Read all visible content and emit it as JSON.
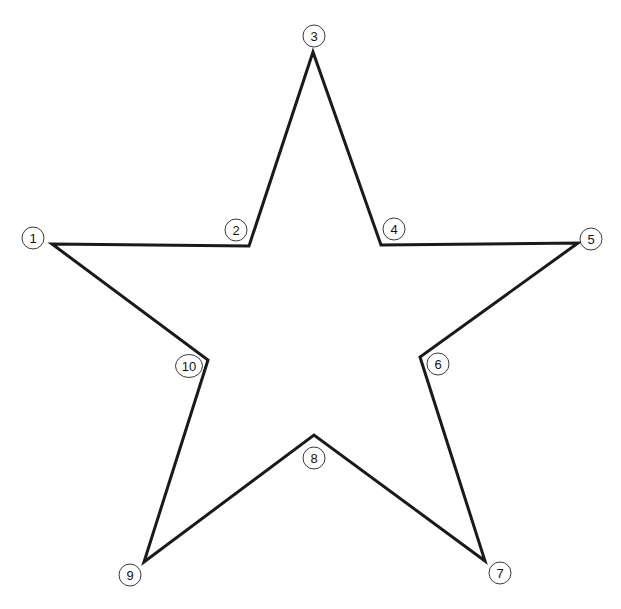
{
  "figure": {
    "background_color": "#ffffff",
    "width": 621,
    "height": 609
  },
  "shape": {
    "name": "five-pointed-star",
    "stroke_color": "#1a1a1a",
    "stroke_width": 3,
    "fill": "none",
    "closed": true,
    "points_order": [
      1,
      2,
      3,
      4,
      5,
      6,
      7,
      8,
      9,
      10
    ],
    "path_points": [
      [
        52,
        244
      ],
      [
        249,
        246
      ],
      [
        313,
        52
      ],
      [
        381,
        245
      ],
      [
        578,
        243
      ],
      [
        420,
        357
      ],
      [
        485,
        561
      ],
      [
        314,
        435
      ],
      [
        144,
        562
      ],
      [
        208,
        360
      ]
    ]
  },
  "markers": {
    "circle_stroke_color": "#3a3a3a",
    "circle_fill_color": "#ffffff",
    "circle_stroke_width": 1,
    "circle_radius": 11,
    "label_color": "#141414",
    "items": [
      {
        "label": "1",
        "vertex_x": 52,
        "vertex_y": 244,
        "circle_x": 33,
        "circle_y": 238,
        "rx": 11,
        "ry": 11
      },
      {
        "label": "2",
        "vertex_x": 249,
        "vertex_y": 246,
        "circle_x": 236,
        "circle_y": 230,
        "rx": 11,
        "ry": 11
      },
      {
        "label": "3",
        "vertex_x": 313,
        "vertex_y": 52,
        "circle_x": 314,
        "circle_y": 36,
        "rx": 11,
        "ry": 11
      },
      {
        "label": "4",
        "vertex_x": 381,
        "vertex_y": 245,
        "circle_x": 394,
        "circle_y": 229,
        "rx": 11,
        "ry": 11
      },
      {
        "label": "5",
        "vertex_x": 578,
        "vertex_y": 243,
        "circle_x": 591,
        "circle_y": 239,
        "rx": 11,
        "ry": 11
      },
      {
        "label": "6",
        "vertex_x": 420,
        "vertex_y": 357,
        "circle_x": 438,
        "circle_y": 364,
        "rx": 11,
        "ry": 11
      },
      {
        "label": "7",
        "vertex_x": 485,
        "vertex_y": 561,
        "circle_x": 500,
        "circle_y": 573,
        "rx": 11,
        "ry": 11
      },
      {
        "label": "8",
        "vertex_x": 314,
        "vertex_y": 435,
        "circle_x": 314,
        "circle_y": 458,
        "rx": 11,
        "ry": 11
      },
      {
        "label": "9",
        "vertex_x": 144,
        "vertex_y": 562,
        "circle_x": 130,
        "circle_y": 575,
        "rx": 11,
        "ry": 11
      },
      {
        "label": "10",
        "vertex_x": 208,
        "vertex_y": 360,
        "circle_x": 189,
        "circle_y": 366,
        "rx": 13.5,
        "ry": 11.5
      }
    ]
  },
  "top_clipped_text": {
    "text": "",
    "visible": true
  }
}
